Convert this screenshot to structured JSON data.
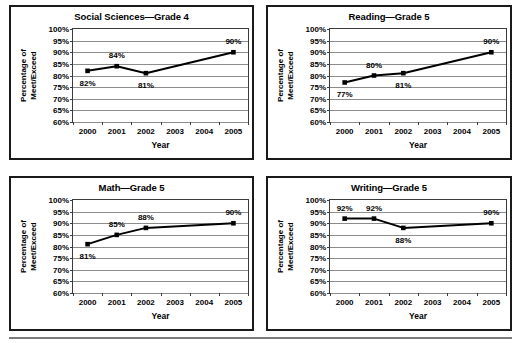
{
  "figure": {
    "layout": "2x2-grid",
    "panel_count": 4,
    "bottom_rule": true
  },
  "axis_common": {
    "xlabel": "Year",
    "ylabel_line1": "Percentage of",
    "ylabel_line2": "Meet/Exceed",
    "ytick_labels": [
      "100%",
      "95%",
      "90%",
      "85%",
      "80%",
      "75%",
      "70%",
      "65%",
      "60%"
    ],
    "xtick_labels": [
      "2000",
      "2001",
      "2002",
      "2003",
      "2004",
      "2005"
    ],
    "ylim": [
      60,
      100
    ],
    "grid": true,
    "legend": "none",
    "line_color": "#000000",
    "marker_color": "#000000",
    "gridline_color": "#8c8c8c"
  },
  "chart_data": [
    {
      "type": "line",
      "title": "Social Sciences—Grade 4",
      "xlabel": "Year",
      "ylabel": "Percentage of Meet/Exceed",
      "categories": [
        "2000",
        "2001",
        "2002",
        "2003",
        "2004",
        "2005"
      ],
      "x": [
        2000,
        2001,
        2002,
        2005
      ],
      "values": [
        82,
        84,
        81,
        90
      ],
      "point_labels": [
        "82%",
        "84%",
        "81%",
        "90%"
      ],
      "label_positions": [
        "below",
        "above",
        "below",
        "above"
      ],
      "ylim": [
        60,
        100
      ],
      "grid": true,
      "legend": "none"
    },
    {
      "type": "line",
      "title": "Reading—Grade 5",
      "xlabel": "Year",
      "ylabel": "Percentage of Meet/Exceed",
      "categories": [
        "2000",
        "2001",
        "2002",
        "2003",
        "2004",
        "2005"
      ],
      "x": [
        2000,
        2001,
        2002,
        2005
      ],
      "values": [
        77,
        80,
        81,
        90
      ],
      "point_labels": [
        "77%",
        "80%",
        "81%",
        "90%"
      ],
      "label_positions": [
        "below",
        "above",
        "below",
        "above"
      ],
      "ylim": [
        60,
        100
      ],
      "grid": true,
      "legend": "none"
    },
    {
      "type": "line",
      "title": "Math—Grade 5",
      "xlabel": "Year",
      "ylabel": "Percentage of Meet/Exceed",
      "categories": [
        "2000",
        "2001",
        "2002",
        "2003",
        "2004",
        "2005"
      ],
      "x": [
        2000,
        2001,
        2002,
        2005
      ],
      "values": [
        81,
        85,
        88,
        90
      ],
      "point_labels": [
        "81%",
        "85%",
        "88%",
        "90%"
      ],
      "label_positions": [
        "below",
        "above",
        "above",
        "above"
      ],
      "ylim": [
        60,
        100
      ],
      "grid": true,
      "legend": "none"
    },
    {
      "type": "line",
      "title": "Writing—Grade 5",
      "xlabel": "Year",
      "ylabel": "Percentage of Meet/Exceed",
      "categories": [
        "2000",
        "2001",
        "2002",
        "2003",
        "2004",
        "2005"
      ],
      "x": [
        2000,
        2001,
        2002,
        2005
      ],
      "values": [
        92,
        92,
        88,
        90
      ],
      "point_labels": [
        "92%",
        "92%",
        "88%",
        "90%"
      ],
      "label_positions": [
        "above",
        "above",
        "below",
        "above"
      ],
      "ylim": [
        60,
        100
      ],
      "grid": true,
      "legend": "none"
    }
  ]
}
